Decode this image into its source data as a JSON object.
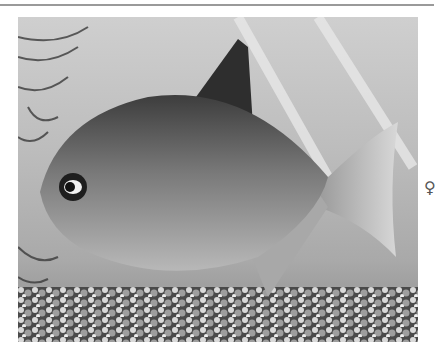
{
  "page": {
    "photo_alt": "Black-and-white photograph of a silver dollar fish (Metynnis) swimming above gravel among aquatic plants",
    "sex_symbol": "♀",
    "sex_label": "female"
  },
  "colors": {
    "background": "#ffffff",
    "rule": "#9a9a9a",
    "water": "#c2c2c2",
    "fish_body": "#8c8c8c",
    "gravel": "#5a5a5a"
  }
}
